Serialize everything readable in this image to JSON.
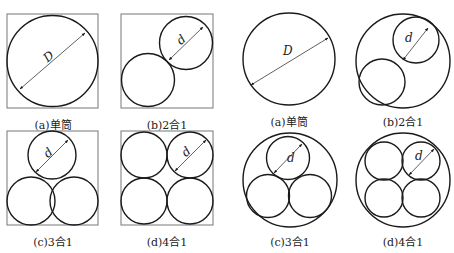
{
  "figure": {
    "dimension_labels": {
      "large": "D",
      "small": "d"
    },
    "colors": {
      "stroke": "#1a1a1a",
      "frame": "#777777",
      "background": "#ffffff"
    },
    "square_panels": [
      {
        "id": "a",
        "caption": "(a)单筒",
        "cylinders": 1
      },
      {
        "id": "b",
        "caption": "(b)2合1",
        "cylinders": 2
      },
      {
        "id": "c",
        "caption": "(c)3合1",
        "cylinders": 3
      },
      {
        "id": "d",
        "caption": "(d)4合1",
        "cylinders": 4
      }
    ],
    "circle_panels": [
      {
        "id": "a",
        "caption": "(a)单筒",
        "cylinders": 1
      },
      {
        "id": "b",
        "caption": "(b)2合1",
        "cylinders": 2
      },
      {
        "id": "c",
        "caption": "(c)3合1",
        "cylinders": 3
      },
      {
        "id": "d",
        "caption": "(d)4合1",
        "cylinders": 4
      }
    ]
  }
}
